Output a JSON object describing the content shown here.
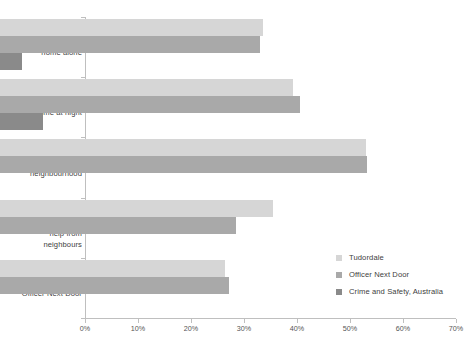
{
  "chart_data": {
    "type": "bar",
    "orientation": "horizontal",
    "title": "",
    "xlabel": "",
    "ylabel": "",
    "xlim": [
      0,
      70
    ],
    "grid": false,
    "legend_position": "inside-bottom-right",
    "xticks": [
      "0%",
      "10%",
      "20%",
      "30%",
      "40%",
      "50%",
      "60%",
      "70%"
    ],
    "xtick_values": [
      0,
      10,
      20,
      30,
      40,
      50,
      60,
      70
    ],
    "categories": [
      "Unsafe at\nhome alone",
      "Unsafe at\nhome at night",
      "Unsafe walking in\nneighbourhood",
      "Not able to\nask for\nhelp from\nneighbours",
      "Not safer with an\nOfficer Next Door"
    ],
    "series": [
      {
        "name": "Tudordale",
        "color": "#d6d6d6",
        "values": [
          49.6,
          55.3,
          69.0,
          51.5,
          42.5
        ]
      },
      {
        "name": "Officer Next Door",
        "color": "#a9a9a9",
        "values": [
          49.0,
          56.6,
          69.2,
          44.5,
          43.2
        ]
      },
      {
        "name": "Crime and Safety, Australia",
        "color": "#8a8a8a",
        "values": [
          4.1,
          8.1,
          null,
          null,
          null
        ]
      }
    ]
  },
  "legend": {
    "items": [
      {
        "label": "Tudordale",
        "color": "#d6d6d6"
      },
      {
        "label": "Officer Next Door",
        "color": "#a9a9a9"
      },
      {
        "label": "Crime and Safety, Australia",
        "color": "#8a8a8a"
      }
    ]
  },
  "axis": {
    "x_tick_labels": [
      "0%",
      "10%",
      "20%",
      "30%",
      "40%",
      "50%",
      "60%",
      "70%"
    ],
    "axis_color": "#bfbfbf"
  }
}
